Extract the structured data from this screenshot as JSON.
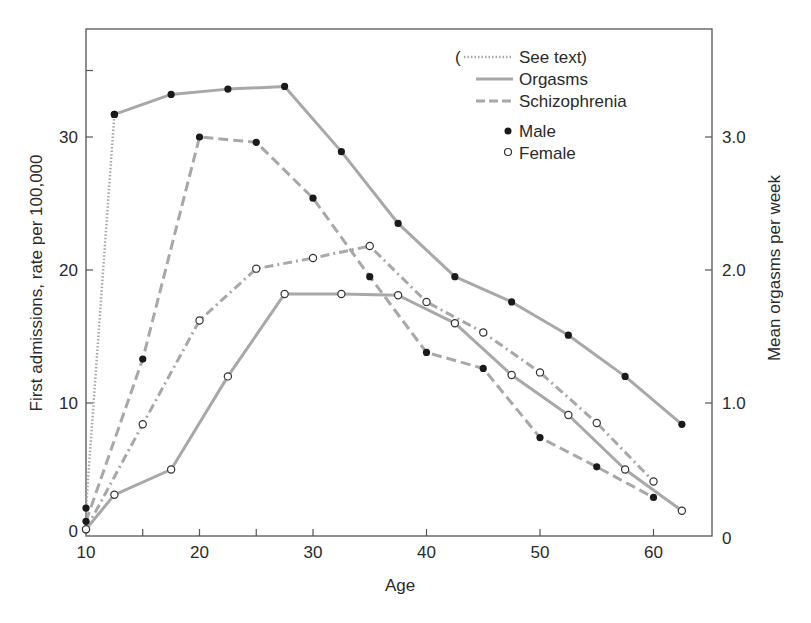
{
  "chart_data": {
    "type": "line",
    "title": "",
    "xlabel": "Age",
    "ylabel": "First admissions, rate per 100,000",
    "ylabel_right": "Mean orgasms per week",
    "xlim": [
      10,
      65
    ],
    "ylim": [
      0,
      38
    ],
    "ylim_right": [
      0,
      3.8
    ],
    "x_ticks": [
      10,
      20,
      30,
      40,
      50,
      60
    ],
    "x_minor_ticks": [
      15,
      25
    ],
    "y_ticks": [
      0,
      10,
      20,
      30
    ],
    "y_minor_ticks": [
      35
    ],
    "y_right_ticks": [
      "0",
      "1.0",
      "2.0",
      "3.0"
    ],
    "grid": false,
    "legend": {
      "position": "upper right",
      "entries": [
        {
          "label": "See text)",
          "prefix": "(",
          "style": "dotted"
        },
        {
          "label": "Orgasms",
          "style": "solid"
        },
        {
          "label": "Schizophrenia",
          "style": "dashed"
        },
        {
          "label": "Male",
          "marker": "filled-circle"
        },
        {
          "label": "Female",
          "marker": "open-circle"
        }
      ]
    },
    "series": [
      {
        "name": "See text (male orgasms, early)",
        "style": "dotted",
        "marker": "filled",
        "axis": "right",
        "x": [
          10,
          12.5
        ],
        "values": [
          0.21,
          3.17
        ]
      },
      {
        "name": "Orgasms, Male",
        "style": "solid",
        "marker": "filled",
        "axis": "right",
        "x": [
          12.5,
          17.5,
          22.5,
          27.5,
          32.5,
          37.5,
          42.5,
          47.5,
          52.5,
          57.5,
          62.5
        ],
        "values": [
          3.17,
          3.32,
          3.36,
          3.38,
          2.89,
          2.35,
          1.95,
          1.76,
          1.51,
          1.2,
          0.84
        ]
      },
      {
        "name": "Orgasms, Female",
        "style": "solid",
        "marker": "open",
        "axis": "right",
        "x": [
          10,
          12.5,
          17.5,
          22.5,
          27.5,
          32.5,
          37.5,
          42.5,
          47.5,
          52.5,
          57.5,
          62.5
        ],
        "values": [
          0.05,
          0.31,
          0.5,
          1.2,
          1.82,
          1.82,
          1.81,
          1.6,
          1.21,
          0.91,
          0.5,
          0.19
        ]
      },
      {
        "name": "Schizophrenia, Male",
        "style": "dashed",
        "marker": "filled",
        "axis": "left",
        "x": [
          10,
          15,
          20,
          25,
          30,
          35,
          40,
          45,
          50,
          55,
          60
        ],
        "values": [
          1.1,
          13.3,
          30.0,
          29.6,
          25.4,
          19.5,
          13.8,
          12.6,
          7.4,
          5.2,
          2.9
        ]
      },
      {
        "name": "Schizophrenia, Female",
        "style": "dash-dot",
        "marker": "open",
        "axis": "left",
        "x": [
          10,
          15,
          20,
          25,
          30,
          35,
          40,
          45,
          50,
          55,
          60
        ],
        "values": [
          0.5,
          8.4,
          16.2,
          20.1,
          20.9,
          21.8,
          17.6,
          15.3,
          12.3,
          8.5,
          4.1
        ]
      }
    ]
  },
  "labels": {
    "xlabel": "Age",
    "ylabel": "First admissions, rate per 100,000",
    "ylabel_right": "Mean orgasms per week",
    "legend_paren": "(",
    "legend_see_text": "See text)",
    "legend_orgasms": "Orgasms",
    "legend_schizophrenia": "Schizophrenia",
    "legend_male": "Male",
    "legend_female": "Female",
    "x_tick_10": "10",
    "x_tick_20": "20",
    "x_tick_30": "30",
    "x_tick_40": "40",
    "x_tick_50": "50",
    "x_tick_60": "60",
    "y_tick_0": "0",
    "y_tick_10": "10",
    "y_tick_20": "20",
    "y_tick_30": "30",
    "yr_tick_0": "0",
    "yr_tick_1": "1.0",
    "yr_tick_2": "2.0",
    "yr_tick_3": "3.0"
  },
  "colors": {
    "line": "#a8a8a8",
    "marker_filled": "#1a1a1a",
    "frame": "#555555",
    "text": "#2a2a2a"
  }
}
